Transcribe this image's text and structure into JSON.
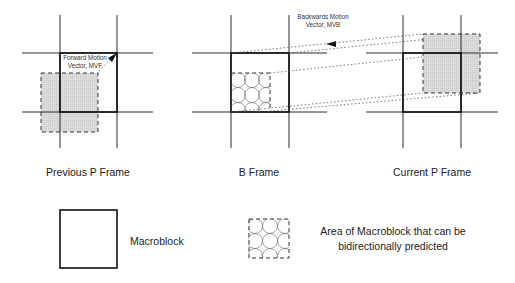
{
  "diagram": {
    "frames": [
      {
        "id": "previous-p",
        "label": "Previous P Frame"
      },
      {
        "id": "b",
        "label": "B Frame"
      },
      {
        "id": "current-p",
        "label": "Current P Frame"
      }
    ],
    "vectors": {
      "forward": {
        "line1": "Forward Motion",
        "line2": "Vector, MVF"
      },
      "backward": {
        "line1": "Backwards Motion",
        "line2": "Vector, MVB"
      }
    },
    "legend": {
      "macroblock": "Macroblock",
      "bidir_line1": "Area of Macroblock that can be",
      "bidir_line2": "bidirectionally predicted"
    },
    "colors": {
      "shade": "#d9d9d9",
      "line": "#2a2a2a"
    }
  }
}
